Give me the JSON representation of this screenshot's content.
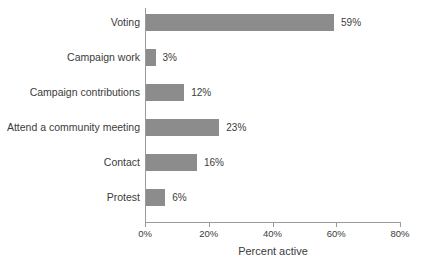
{
  "chart_data": {
    "type": "bar",
    "orientation": "horizontal",
    "title": "",
    "xlabel": "Percent active",
    "ylabel": "",
    "xlim": [
      0,
      80
    ],
    "xticks": [
      "0%",
      "20%",
      "40%",
      "60%",
      "80%"
    ],
    "xtick_values": [
      0,
      20,
      40,
      60,
      80
    ],
    "grid": false,
    "legend": false,
    "bar_color": "#8c8c8c",
    "axis_color": "#9a9a9a",
    "text_color": "#3b3b3b",
    "background": "#ffffff",
    "categories": [
      "Voting",
      "Campaign work",
      "Campaign contributions",
      "Attend a community meeting",
      "Contact",
      "Protest"
    ],
    "values": [
      59,
      3,
      12,
      23,
      16,
      6
    ],
    "value_labels": [
      "59%",
      "3%",
      "12%",
      "23%",
      "16%",
      "6%"
    ]
  }
}
